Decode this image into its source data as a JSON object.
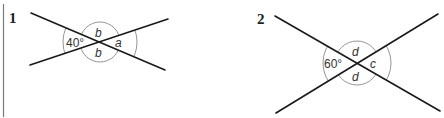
{
  "figures": [
    {
      "number": "1",
      "given_angle": "40°",
      "vertically_opposite_label": "b",
      "top_label": "b",
      "bottom_label": "b",
      "right_label": "a"
    },
    {
      "number": "2",
      "given_angle": "60°",
      "top_label": "d",
      "bottom_label": "d",
      "right_label": "c"
    }
  ],
  "colors": {
    "line": "#1a1a1a",
    "arc": "#8a8a8a",
    "margin_bar": "#7a7a7a"
  }
}
